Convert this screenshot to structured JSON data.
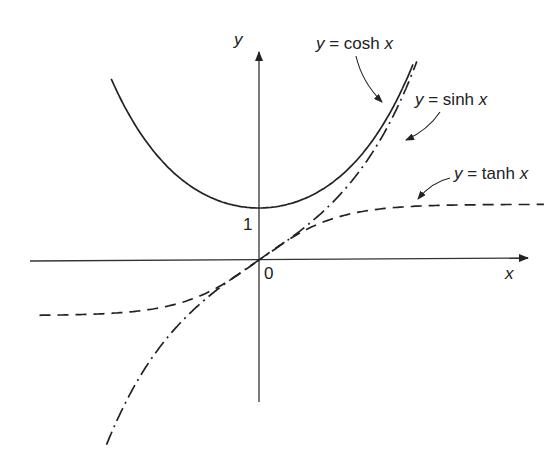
{
  "chart_data": {
    "type": "line",
    "title": "",
    "xlabel": "x",
    "ylabel": "y",
    "tick_labels": {
      "origin": "0",
      "y_one": "1"
    },
    "series": [
      {
        "name": "y = cosh x",
        "style": "solid",
        "x": [
          -1.92,
          -1.5,
          -1,
          -0.5,
          0,
          0.5,
          1,
          1.5,
          2.0
        ],
        "values": [
          3.48,
          2.35,
          1.54,
          1.13,
          1.0,
          1.13,
          1.54,
          2.35,
          3.76
        ]
      },
      {
        "name": "y = sinh x",
        "style": "dash-dot",
        "x": [
          -2.0,
          -1.5,
          -1,
          -0.5,
          0,
          0.5,
          1,
          1.5,
          2.05
        ],
        "values": [
          -3.63,
          -2.13,
          -1.18,
          -0.52,
          0,
          0.52,
          1.18,
          2.13,
          3.8
        ]
      },
      {
        "name": "y = tanh x",
        "style": "dashed",
        "x": [
          -2.85,
          -2,
          -1,
          0,
          1,
          2,
          3.7
        ],
        "values": [
          -1.0,
          -0.96,
          -0.76,
          0,
          0.76,
          0.96,
          1.0
        ]
      }
    ]
  },
  "labels": {
    "cosh": {
      "y": "y",
      "eq": " = cosh ",
      "x": "x"
    },
    "sinh": {
      "y": "y",
      "eq": " = sinh ",
      "x": "x"
    },
    "tanh": {
      "y": "y",
      "eq": " = tanh ",
      "x": "x"
    },
    "axis_x": "x",
    "axis_y": "y",
    "origin": "0",
    "one": "1"
  }
}
